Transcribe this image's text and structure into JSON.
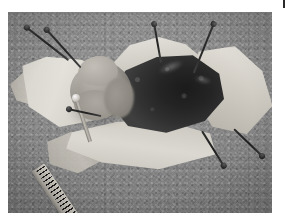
{
  "page": {
    "background_color": "#ffffff",
    "width": 291,
    "height": 224
  },
  "registration_mark": {
    "name": "top-right-tick",
    "color": "#2a2a2a",
    "description": "thin vertical tick mark in the upper right margin"
  },
  "photograph": {
    "caption": "",
    "type": "grayscale anatomical dissection photograph",
    "subject": "small mammal specimen pinned open for necropsy",
    "frame": {
      "left": 8,
      "top": 12,
      "width": 264,
      "height": 201
    },
    "background_description": "speckled gray dissection tray surface",
    "background_color": "#8b8b8b"
  },
  "specimen": {
    "open_cavity": {
      "label": "opened thoracic and abdominal cavity",
      "color": "#1e1e1e"
    },
    "organ_mass": {
      "label": "exposed pale organ mass",
      "color": "#a5a199"
    },
    "skin_flaps": [
      {
        "label": "cranial skin and fur flap",
        "color": "#d6d3cb"
      },
      {
        "label": "left lateral skin and fur flap",
        "color": "#e6e3dc"
      },
      {
        "label": "right lateral skin and fur flap",
        "color": "#d2cec5"
      },
      {
        "label": "caudal skin and fur flap",
        "color": "#e3e0d9"
      },
      {
        "label": "far left limb flap",
        "color": "#d4d0c7"
      },
      {
        "label": "lower left limb flap",
        "color": "#cdc9c0"
      }
    ],
    "probe": {
      "label": "metal dissection probe",
      "color": "#cfcbc3"
    }
  },
  "pins": [
    {
      "name": "pin-upper-left",
      "left": 18,
      "top": 14,
      "length": 54,
      "angle": 38,
      "head": "start"
    },
    {
      "name": "pin-upper-left-inner",
      "left": 38,
      "top": 16,
      "length": 52,
      "angle": 48,
      "head": "start"
    },
    {
      "name": "pin-top-center",
      "left": 146,
      "top": 10,
      "length": 40,
      "angle": 80,
      "head": "start"
    },
    {
      "name": "pin-top-right",
      "left": 206,
      "top": 10,
      "length": 54,
      "angle": 112,
      "head": "start"
    },
    {
      "name": "pin-right-lower",
      "left": 194,
      "top": 118,
      "length": 42,
      "angle": 58,
      "head": "end"
    },
    {
      "name": "pin-right-outer",
      "left": 226,
      "top": 116,
      "length": 40,
      "angle": 44,
      "head": "end"
    },
    {
      "name": "pin-left-mid",
      "left": 60,
      "top": 96,
      "length": 34,
      "angle": 12,
      "head": "start"
    }
  ],
  "scale_bar": {
    "label": "graduated measuring scale",
    "color": "#c2beb6",
    "tick_color": "#1c1c1c"
  }
}
